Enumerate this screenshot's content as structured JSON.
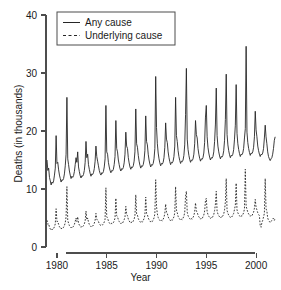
{
  "chart_data": {
    "type": "line",
    "title": "",
    "xlabel": "Year",
    "ylabel": "Deaths (in thousands)",
    "xlim": [
      1978.9,
      2002.0
    ],
    "ylim": [
      0,
      40
    ],
    "xticks": [
      1980,
      1985,
      1990,
      1995,
      2000
    ],
    "xticklabels": [
      "1980",
      "1985",
      "1990",
      "1995",
      "2000"
    ],
    "yticks": [
      0,
      10,
      20,
      30,
      40
    ],
    "yticklabels": [
      "0",
      "10",
      "20",
      "30",
      "40"
    ],
    "grid": false,
    "legend_position": "top-left",
    "legend": [
      "Any cause",
      "Underlying cause"
    ],
    "x_unit": "month",
    "x_start": 1979.0,
    "x_step": 0.0833333,
    "series": [
      {
        "name": "Any cause",
        "style": "solid",
        "color": "#262626",
        "values": [
          15.0,
          13.2,
          13.6,
          12.0,
          11.4,
          10.7,
          11.2,
          11.0,
          11.4,
          12.4,
          13.6,
          19.2,
          14.4,
          14.6,
          13.3,
          12.4,
          11.8,
          11.2,
          11.6,
          11.5,
          11.8,
          12.6,
          14.0,
          16.0,
          25.8,
          15.2,
          14.2,
          13.1,
          12.4,
          11.8,
          12.2,
          12.0,
          12.3,
          13.0,
          14.2,
          15.4,
          14.6,
          16.4,
          13.8,
          13.0,
          12.3,
          11.9,
          12.3,
          12.2,
          12.5,
          13.2,
          14.6,
          18.2,
          15.4,
          16.0,
          14.2,
          13.4,
          12.7,
          12.2,
          12.6,
          12.5,
          12.8,
          13.5,
          14.8,
          17.4,
          15.6,
          14.8,
          14.0,
          13.2,
          12.7,
          12.4,
          12.8,
          12.7,
          13.0,
          13.8,
          15.2,
          24.4,
          16.4,
          16.0,
          14.6,
          13.8,
          13.2,
          12.8,
          13.2,
          13.1,
          13.4,
          14.2,
          15.6,
          21.8,
          17.0,
          16.4,
          15.0,
          14.2,
          13.5,
          13.1,
          13.5,
          13.4,
          13.7,
          14.5,
          16.0,
          19.8,
          17.4,
          17.0,
          15.4,
          14.5,
          13.8,
          13.4,
          13.8,
          13.7,
          14.0,
          14.8,
          16.4,
          23.8,
          17.8,
          17.2,
          15.8,
          14.8,
          14.1,
          13.6,
          14.0,
          13.9,
          14.2,
          15.0,
          16.6,
          22.6,
          18.2,
          17.6,
          16.0,
          15.0,
          14.3,
          13.8,
          14.2,
          14.1,
          14.4,
          15.2,
          17.0,
          29.4,
          20.6,
          17.8,
          16.2,
          15.2,
          14.5,
          14.0,
          14.4,
          14.3,
          14.6,
          15.4,
          17.2,
          21.4,
          18.6,
          18.0,
          16.4,
          15.4,
          14.7,
          14.2,
          14.6,
          14.5,
          14.8,
          15.6,
          17.4,
          25.8,
          19.2,
          18.2,
          16.6,
          15.6,
          14.9,
          14.4,
          14.8,
          14.7,
          15.0,
          15.8,
          17.6,
          22.8,
          30.8,
          18.6,
          16.8,
          15.8,
          15.1,
          14.6,
          15.0,
          14.9,
          15.2,
          16.0,
          17.8,
          21.8,
          19.4,
          18.8,
          17.0,
          16.0,
          15.3,
          14.8,
          15.2,
          15.1,
          15.4,
          16.2,
          18.0,
          22.4,
          24.4,
          19.0,
          17.2,
          16.2,
          15.5,
          15.0,
          15.4,
          15.3,
          15.6,
          16.4,
          18.2,
          21.2,
          27.4,
          19.2,
          17.4,
          16.4,
          15.7,
          15.2,
          15.6,
          15.5,
          15.8,
          16.6,
          18.4,
          22.0,
          29.8,
          19.4,
          17.6,
          16.6,
          15.9,
          15.4,
          15.8,
          15.7,
          16.0,
          16.8,
          18.6,
          21.0,
          28.0,
          19.6,
          17.8,
          16.8,
          16.1,
          15.6,
          16.0,
          15.9,
          16.2,
          17.0,
          18.8,
          20.4,
          34.6,
          19.8,
          18.0,
          17.0,
          16.3,
          15.8,
          16.2,
          16.1,
          16.4,
          17.2,
          19.0,
          23.4,
          20.2,
          19.0,
          17.4,
          16.6,
          16.0,
          15.6,
          16.0,
          15.9,
          16.2,
          17.0,
          18.8,
          21.0,
          19.0,
          17.8,
          16.4,
          15.6,
          15.2,
          14.9,
          15.2,
          15.4,
          16.0,
          17.0,
          18.4,
          19.0
        ]
      },
      {
        "name": "Underlying cause",
        "style": "dashed",
        "color": "#262626",
        "values": [
          4.6,
          3.9,
          4.0,
          3.4,
          3.1,
          2.9,
          3.1,
          3.0,
          3.2,
          3.5,
          4.0,
          6.6,
          4.4,
          4.4,
          3.9,
          3.5,
          3.3,
          3.1,
          3.3,
          3.2,
          3.4,
          3.7,
          4.2,
          5.2,
          10.4,
          4.6,
          4.1,
          3.7,
          3.5,
          3.3,
          3.5,
          3.4,
          3.6,
          3.9,
          4.4,
          5.0,
          4.4,
          5.2,
          4.1,
          3.8,
          3.6,
          3.4,
          3.6,
          3.5,
          3.7,
          4.0,
          4.5,
          6.2,
          4.7,
          5.0,
          4.3,
          3.9,
          3.7,
          3.5,
          3.7,
          3.6,
          3.8,
          4.1,
          4.6,
          5.8,
          4.8,
          4.6,
          4.4,
          4.0,
          3.8,
          3.7,
          3.9,
          3.8,
          4.0,
          4.3,
          4.8,
          10.2,
          5.2,
          5.0,
          4.5,
          4.2,
          4.0,
          3.9,
          4.1,
          4.0,
          4.2,
          4.5,
          5.0,
          8.4,
          5.4,
          5.2,
          4.7,
          4.4,
          4.2,
          4.0,
          4.2,
          4.1,
          4.4,
          4.7,
          5.2,
          7.0,
          5.6,
          5.4,
          4.8,
          4.5,
          4.3,
          4.1,
          4.3,
          4.2,
          4.5,
          4.8,
          5.4,
          9.0,
          5.7,
          5.5,
          4.9,
          4.6,
          4.4,
          4.2,
          4.4,
          4.3,
          4.6,
          4.9,
          5.5,
          8.6,
          5.8,
          5.6,
          5.0,
          4.7,
          4.5,
          4.3,
          4.5,
          4.4,
          4.7,
          5.0,
          5.7,
          11.6,
          7.0,
          5.7,
          5.1,
          4.8,
          4.6,
          4.4,
          4.6,
          4.5,
          4.8,
          5.1,
          5.8,
          7.4,
          6.0,
          5.8,
          5.2,
          4.9,
          4.7,
          4.5,
          4.7,
          4.6,
          4.9,
          5.2,
          5.9,
          10.4,
          6.4,
          5.9,
          5.3,
          5.0,
          4.8,
          4.6,
          4.8,
          4.7,
          5.0,
          5.3,
          6.0,
          8.8,
          9.6,
          6.0,
          5.4,
          5.1,
          4.9,
          4.7,
          4.9,
          4.8,
          5.1,
          5.4,
          6.1,
          7.6,
          6.2,
          6.0,
          5.5,
          5.2,
          5.0,
          4.8,
          5.0,
          4.9,
          5.2,
          5.5,
          6.2,
          8.0,
          8.4,
          6.1,
          5.6,
          5.3,
          5.1,
          4.9,
          5.1,
          5.0,
          5.3,
          5.6,
          6.3,
          7.4,
          9.6,
          6.2,
          5.7,
          5.4,
          5.2,
          5.0,
          5.2,
          5.1,
          5.4,
          5.7,
          6.4,
          7.8,
          11.8,
          6.3,
          5.8,
          5.5,
          5.3,
          5.1,
          5.3,
          5.2,
          5.5,
          5.8,
          6.5,
          7.2,
          11.0,
          6.4,
          5.9,
          5.6,
          5.4,
          5.2,
          5.4,
          5.3,
          5.6,
          5.9,
          6.6,
          13.4,
          7.0,
          6.5,
          6.0,
          5.7,
          5.5,
          5.3,
          5.5,
          5.4,
          5.7,
          6.0,
          6.7,
          8.2,
          6.8,
          6.4,
          5.9,
          5.6,
          5.4,
          3.6,
          3.4,
          4.2,
          4.6,
          5.2,
          5.8,
          11.8,
          6.6,
          6.2,
          5.0,
          4.6,
          4.4,
          4.2,
          4.4,
          4.6,
          4.8,
          5.0,
          4.6,
          4.9
        ]
      }
    ]
  }
}
